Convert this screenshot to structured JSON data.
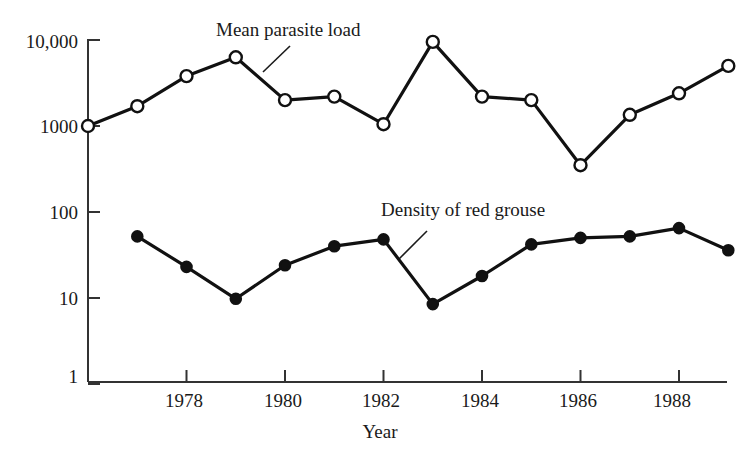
{
  "chart_data": {
    "type": "line",
    "title": "",
    "xlabel": "Year",
    "ylabel": "",
    "xlim": [
      1976,
      1989
    ],
    "ylim": [
      1,
      10000
    ],
    "yscale": "log",
    "grid": false,
    "legend_position": "inline-annotations",
    "ytick_labels": [
      "10,000",
      "1000",
      "100",
      "10",
      "1"
    ],
    "ytick_values": [
      10000,
      1000,
      100,
      10,
      1
    ],
    "xtick_labels": [
      "1978",
      "1980",
      "1982",
      "1984",
      "1986",
      "1988"
    ],
    "xtick_values": [
      1978,
      1980,
      1982,
      1984,
      1986,
      1988
    ],
    "x": [
      1976,
      1977,
      1978,
      1979,
      1980,
      1981,
      1982,
      1983,
      1984,
      1985,
      1986,
      1987,
      1988,
      1989
    ],
    "series": [
      {
        "name": "Mean parasite load",
        "marker": "open-circle",
        "x": [
          1976,
          1977,
          1978,
          1979,
          1980,
          1981,
          1982,
          1983,
          1984,
          1985,
          1986,
          1987,
          1988,
          1989
        ],
        "values": [
          1000,
          1700,
          3800,
          6300,
          2000,
          2200,
          1050,
          9500,
          2200,
          2000,
          350,
          1350,
          2400,
          5000
        ]
      },
      {
        "name": "Density of red grouse",
        "marker": "filled-circle",
        "x": [
          1977,
          1978,
          1979,
          1980,
          1981,
          1982,
          1983,
          1984,
          1985,
          1986,
          1987,
          1988,
          1989
        ],
        "values": [
          52,
          23,
          9.8,
          24,
          40,
          48,
          8.5,
          18,
          42,
          50,
          52,
          65,
          36
        ]
      }
    ],
    "annotations": [
      {
        "text": "Mean parasite load",
        "target_series": "Mean parasite load"
      },
      {
        "text": "Density of red grouse",
        "target_series": "Density of red grouse"
      }
    ],
    "colors": {
      "line": "#111111",
      "open_marker_fill": "#ffffff",
      "filled_marker_fill": "#111111",
      "axis": "#333333",
      "text": "#1a1a1a"
    }
  }
}
